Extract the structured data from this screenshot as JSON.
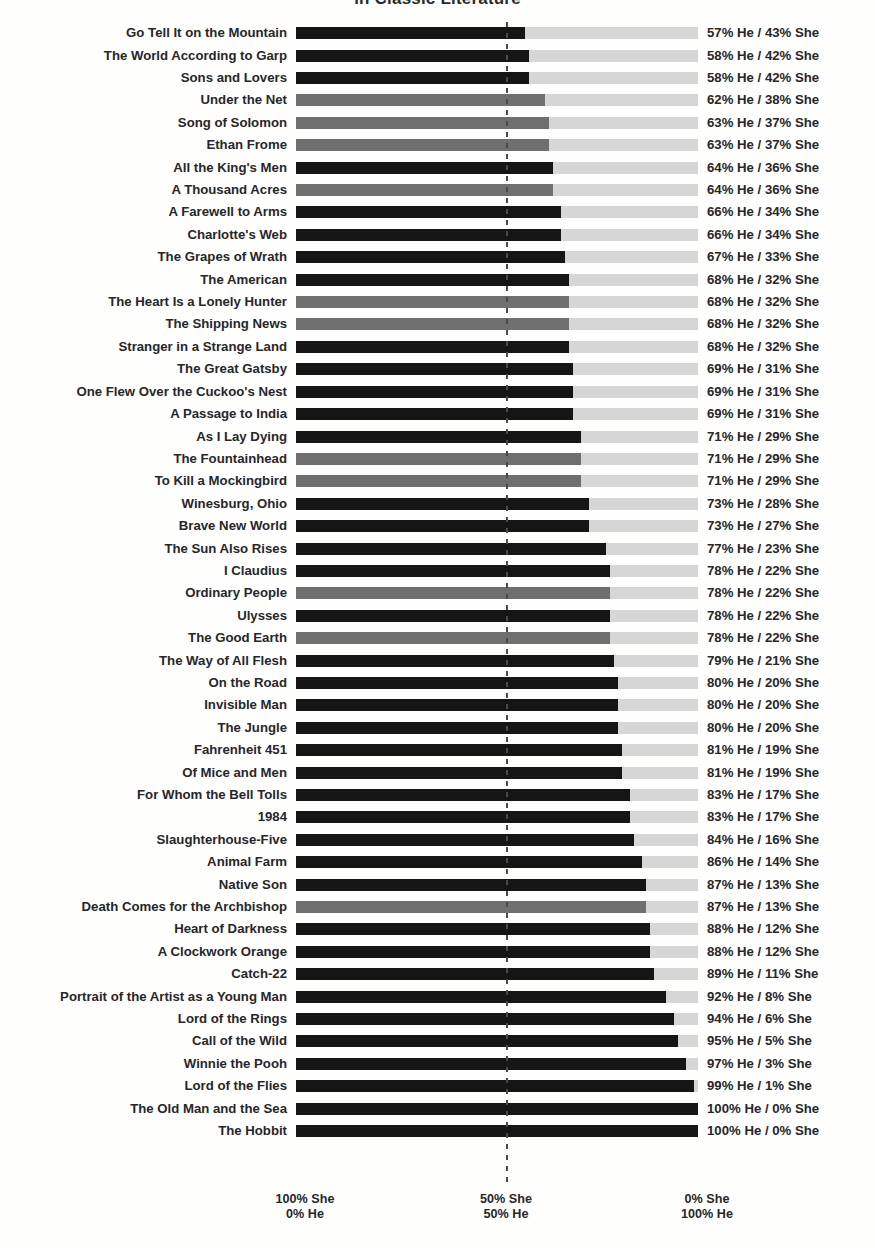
{
  "chart_data": {
    "type": "bar",
    "title": "in Classic Literature",
    "xlabel": "",
    "ylabel": "",
    "orientation": "horizontal",
    "stacked": true,
    "grid": false,
    "legend": "none",
    "xlim": [
      0,
      100
    ],
    "midline_value": 50,
    "axis_ticks": [
      {
        "pos": 0,
        "line1": "100% She",
        "line2": "0% He"
      },
      {
        "pos": 50,
        "line1": "50% She",
        "line2": "50% He"
      },
      {
        "pos": 100,
        "line1": "0% She",
        "line2": "100% He"
      }
    ],
    "series": [
      {
        "name": "He",
        "color": "#151515"
      },
      {
        "name": "She",
        "color": "#d6d6d6"
      }
    ],
    "categories": [
      "Go Tell It on the Mountain",
      "The World According to Garp",
      "Sons and Lovers",
      "Under the Net",
      "Song of Solomon",
      "Ethan Frome",
      "All the King's Men",
      "A Thousand Acres",
      "A Farewell to Arms",
      "Charlotte's Web",
      "The Grapes of Wrath",
      "The American",
      "The Heart Is a Lonely Hunter",
      "The Shipping News",
      "Stranger in a Strange Land",
      "The Great Gatsby",
      "One Flew Over the Cuckoo's Nest",
      "A Passage to India",
      "As I Lay Dying",
      "The Fountainhead",
      "To Kill a Mockingbird",
      "Winesburg, Ohio",
      "Brave New World",
      "The Sun Also Rises",
      "I Claudius",
      "Ordinary People",
      "Ulysses",
      "The Good Earth",
      "The Way of All Flesh",
      "On the Road",
      "Invisible Man",
      "The Jungle",
      "Fahrenheit 451",
      "Of Mice and Men",
      "For Whom the Bell Tolls",
      "1984",
      "Slaughterhouse-Five",
      "Animal Farm",
      "Native Son",
      "Death Comes for the Archbishop",
      "Heart of Darkness",
      "A Clockwork Orange",
      "Catch-22",
      "Portrait of the Artist as a Young Man",
      "Lord of the Rings",
      "Call of the Wild",
      "Winnie the Pooh",
      "Lord of the Flies",
      "The Old Man and the Sea",
      "The Hobbit"
    ],
    "he_values": [
      57,
      58,
      58,
      62,
      63,
      63,
      64,
      64,
      66,
      66,
      67,
      68,
      68,
      68,
      68,
      69,
      69,
      69,
      71,
      71,
      71,
      73,
      73,
      77,
      78,
      78,
      78,
      78,
      79,
      80,
      80,
      80,
      81,
      81,
      83,
      83,
      84,
      86,
      87,
      87,
      88,
      88,
      89,
      92,
      94,
      95,
      97,
      99,
      100,
      100
    ],
    "she_values": [
      43,
      42,
      42,
      38,
      37,
      37,
      36,
      36,
      34,
      34,
      33,
      32,
      32,
      32,
      32,
      31,
      31,
      31,
      29,
      29,
      29,
      28,
      27,
      23,
      22,
      22,
      22,
      22,
      21,
      20,
      20,
      20,
      19,
      19,
      17,
      17,
      16,
      14,
      13,
      13,
      12,
      12,
      11,
      8,
      6,
      5,
      3,
      1,
      0,
      0
    ],
    "bar_shades": [
      "dark",
      "dark",
      "dark",
      "mid",
      "mid",
      "mid",
      "dark",
      "mid",
      "dark",
      "dark",
      "dark",
      "dark",
      "mid",
      "mid",
      "dark",
      "dark",
      "dark",
      "dark",
      "dark",
      "mid",
      "mid",
      "dark",
      "dark",
      "dark",
      "dark",
      "mid",
      "dark",
      "mid",
      "dark",
      "dark",
      "dark",
      "dark",
      "dark",
      "dark",
      "dark",
      "dark",
      "dark",
      "dark",
      "dark",
      "mid",
      "dark",
      "dark",
      "dark",
      "dark",
      "dark",
      "dark",
      "dark",
      "dark",
      "dark",
      "dark"
    ],
    "value_labels": [
      "57% He / 43% She",
      "58% He / 42% She",
      "58% He / 42% She",
      "62% He / 38% She",
      "63% He / 37% She",
      "63% He / 37% She",
      "64% He / 36% She",
      "64% He / 36% She",
      "66% He / 34% She",
      "66% He / 34% She",
      "67% He / 33% She",
      "68% He / 32% She",
      "68% He / 32% She",
      "68% He / 32% She",
      "68% He / 32% She",
      "69% He / 31% She",
      "69% He / 31% She",
      "69% He / 31% She",
      "71% He / 29% She",
      "71% He / 29% She",
      "71% He / 29% She",
      "73% He / 28% She",
      "73% He / 27% She",
      "77% He / 23% She",
      "78% He / 22% She",
      "78% He / 22% She",
      "78% He / 22% She",
      "78% He / 22% She",
      "79% He / 21% She",
      "80% He / 20% She",
      "80% He / 20% She",
      "80% He / 20% She",
      "81% He / 19% She",
      "81% He / 19% She",
      "83% He / 17% She",
      "83% He / 17% She",
      "84% He / 16% She",
      "86% He / 14% She",
      "87% He / 13% She",
      "87% He / 13% She",
      "88% He / 12% She",
      "88% He / 12% She",
      "89% He / 11% She",
      "92% He / 8% She",
      "94% He / 6% She",
      "95% He / 5% She",
      "97% He / 3% She",
      "99% He / 1% She",
      "100% He / 0% She",
      "100% He / 0% She"
    ],
    "colors": {
      "bar_dark": "#151515",
      "bar_mid": "#6f6f6f",
      "bar_track": "#d6d6d6",
      "midline": "#4a4a4a",
      "text": "#27272a",
      "background": "#fefefd"
    }
  }
}
